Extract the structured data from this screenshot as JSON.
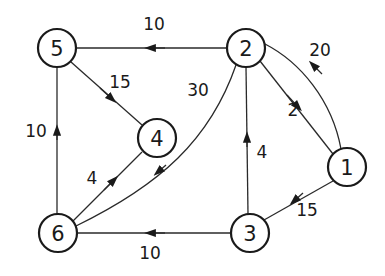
{
  "diagram": {
    "type": "directed-weighted-graph",
    "colors": {
      "stroke": "#1a1a1a",
      "background": "#ffffff"
    },
    "nodes": [
      {
        "id": "1",
        "label": "1",
        "x": 347,
        "y": 167
      },
      {
        "id": "2",
        "label": "2",
        "x": 246,
        "y": 48
      },
      {
        "id": "3",
        "label": "3",
        "x": 250,
        "y": 233
      },
      {
        "id": "4",
        "label": "4",
        "x": 157,
        "y": 138
      },
      {
        "id": "5",
        "label": "5",
        "x": 57,
        "y": 48
      },
      {
        "id": "6",
        "label": "6",
        "x": 58,
        "y": 233
      }
    ],
    "edges": [
      {
        "from": "2",
        "to": "5",
        "weight": "10",
        "label_x": 154,
        "label_y": 24
      },
      {
        "from": "1",
        "to": "2",
        "weight": "20",
        "label_x": 320,
        "label_y": 50
      },
      {
        "from": "2",
        "to": "1",
        "weight": "2",
        "label_x": 293,
        "label_y": 110
      },
      {
        "from": "2",
        "to": "6",
        "weight": "30",
        "label_x": 198,
        "label_y": 90
      },
      {
        "from": "5",
        "to": "4",
        "weight": "15",
        "label_x": 120,
        "label_y": 82
      },
      {
        "from": "6",
        "to": "5",
        "weight": "10",
        "label_x": 36,
        "label_y": 131
      },
      {
        "from": "6",
        "to": "4",
        "weight": "4",
        "label_x": 92,
        "label_y": 178
      },
      {
        "from": "3",
        "to": "2",
        "weight": "4",
        "label_x": 262,
        "label_y": 152
      },
      {
        "from": "1",
        "to": "3",
        "weight": "15",
        "label_x": 307,
        "label_y": 210
      },
      {
        "from": "3",
        "to": "6",
        "weight": "10",
        "label_x": 150,
        "label_y": 253
      }
    ]
  }
}
